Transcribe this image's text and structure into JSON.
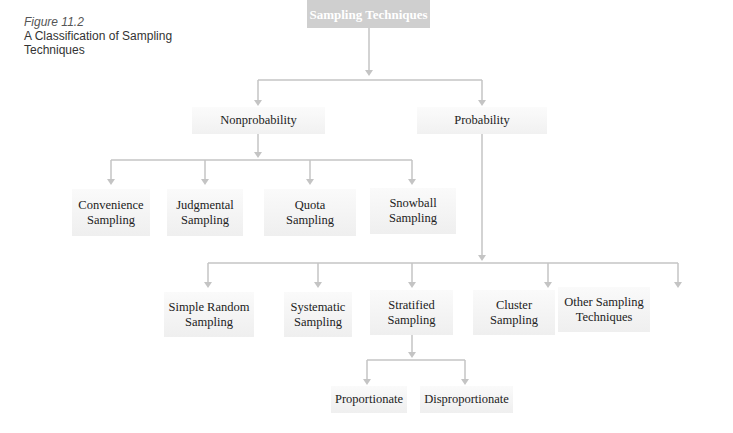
{
  "caption": {
    "figure_label": "Figure 11.2",
    "title_line1": "A Classification of Sampling",
    "title_line2": "Techniques"
  },
  "diagram": {
    "root": "Sampling Techniques",
    "level1": {
      "nonprobability": "Nonprobability",
      "probability": "Probability"
    },
    "nonprobability_children": [
      {
        "line1": "Convenience",
        "line2": "Sampling"
      },
      {
        "line1": "Judgmental",
        "line2": "Sampling"
      },
      {
        "line1": "Quota",
        "line2": "Sampling"
      },
      {
        "line1": "Snowball",
        "line2": "Sampling"
      }
    ],
    "probability_children": [
      {
        "line1": "Simple Random",
        "line2": "Sampling"
      },
      {
        "line1": "Systematic",
        "line2": "Sampling"
      },
      {
        "line1": "Stratified",
        "line2": "Sampling"
      },
      {
        "line1": "Cluster",
        "line2": "Sampling"
      },
      {
        "line1": "Other Sampling",
        "line2": "Techniques"
      }
    ],
    "stratified_children": [
      "Proportionate",
      "Disproportionate"
    ]
  },
  "colors": {
    "root_fill": "#cfcfcf",
    "connector": "#c4c4c4",
    "node_fill": "#f2f2f2"
  }
}
